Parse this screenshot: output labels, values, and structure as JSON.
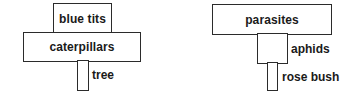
{
  "diagram_type": "pyramid of numbers",
  "pyramids": [
    {
      "levels": [
        {
          "label": "blue tits",
          "label_position": "inside"
        },
        {
          "label": "caterpillars",
          "label_position": "inside"
        },
        {
          "label": "tree",
          "label_position": "right"
        }
      ]
    },
    {
      "levels": [
        {
          "label": "parasites",
          "label_position": "inside"
        },
        {
          "label": "aphids",
          "label_position": "right"
        },
        {
          "label": "rose bush",
          "label_position": "right"
        }
      ]
    }
  ]
}
